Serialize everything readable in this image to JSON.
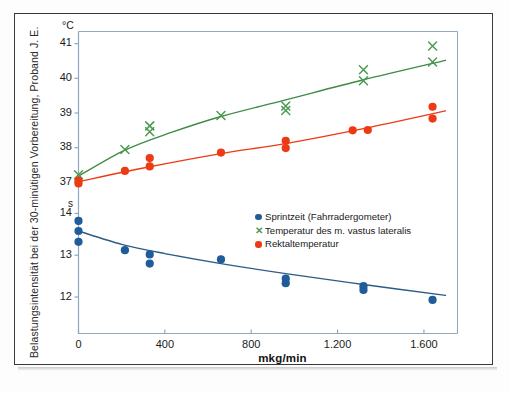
{
  "chart_data": {
    "type": "scatter",
    "title": "",
    "xlabel": "mkg/min",
    "ylabel": "Belastungsintensität bei der 30-minütigen Vorbereitung, Proband J. E.",
    "xlim": [
      -120,
      1760
    ],
    "xticks": [
      0,
      400,
      800,
      1200,
      1600
    ],
    "xticklabels": [
      "0",
      "400",
      "800",
      "1.200",
      "1.600"
    ],
    "axes": [
      {
        "name": "upper-temperature-axis",
        "unit": "°C",
        "ylim": [
          36.55,
          41.35
        ],
        "yticks": [
          37,
          38,
          39,
          40,
          41
        ],
        "yticklabels": [
          "37",
          "38",
          "39",
          "40",
          "41"
        ]
      },
      {
        "name": "lower-time-axis",
        "unit": "s",
        "ylim": [
          11.45,
          14.25
        ],
        "yticks": [
          12,
          13,
          14
        ],
        "yticklabels": [
          "12",
          "13",
          "14"
        ]
      }
    ],
    "grid": false,
    "legend_position": "center-right",
    "series": [
      {
        "name": "Sprintzeit (Fahrradergometer)",
        "axis": "lower-time-axis",
        "marker": "circle",
        "color": "#1F5C99",
        "line_color": "#2B5C86",
        "unit": "s",
        "points": [
          {
            "x": 0,
            "y": 13.82
          },
          {
            "x": 0,
            "y": 13.58
          },
          {
            "x": 0,
            "y": 13.32
          },
          {
            "x": 215,
            "y": 13.12
          },
          {
            "x": 330,
            "y": 13.02
          },
          {
            "x": 330,
            "y": 12.8
          },
          {
            "x": 660,
            "y": 12.9
          },
          {
            "x": 960,
            "y": 12.44
          },
          {
            "x": 960,
            "y": 12.33
          },
          {
            "x": 1320,
            "y": 12.26
          },
          {
            "x": 1320,
            "y": 12.17
          },
          {
            "x": 1640,
            "y": 11.93
          }
        ],
        "fit": [
          {
            "x": 0,
            "y": 13.58
          },
          {
            "x": 200,
            "y": 13.26
          },
          {
            "x": 400,
            "y": 13.04
          },
          {
            "x": 660,
            "y": 12.8
          },
          {
            "x": 960,
            "y": 12.56
          },
          {
            "x": 1320,
            "y": 12.3
          },
          {
            "x": 1700,
            "y": 12.04
          }
        ]
      },
      {
        "name": "Temperatur des m. vastus lateralis",
        "axis": "upper-temperature-axis",
        "marker": "x",
        "color": "#4C9A52",
        "line_color": "#3E8A46",
        "unit": "°C",
        "points": [
          {
            "x": 0,
            "y": 37.22
          },
          {
            "x": 215,
            "y": 37.95
          },
          {
            "x": 330,
            "y": 38.63
          },
          {
            "x": 330,
            "y": 38.46
          },
          {
            "x": 660,
            "y": 38.93
          },
          {
            "x": 960,
            "y": 39.2
          },
          {
            "x": 960,
            "y": 39.07
          },
          {
            "x": 1320,
            "y": 40.25
          },
          {
            "x": 1320,
            "y": 39.93
          },
          {
            "x": 1640,
            "y": 40.93
          },
          {
            "x": 1640,
            "y": 40.47
          }
        ],
        "fit": [
          {
            "x": 0,
            "y": 37.18
          },
          {
            "x": 215,
            "y": 37.93
          },
          {
            "x": 430,
            "y": 38.44
          },
          {
            "x": 660,
            "y": 38.9
          },
          {
            "x": 960,
            "y": 39.38
          },
          {
            "x": 1320,
            "y": 39.96
          },
          {
            "x": 1700,
            "y": 40.52
          }
        ]
      },
      {
        "name": "Rektaltemperatur",
        "axis": "upper-temperature-axis",
        "marker": "circle",
        "color": "#EE3A14",
        "line_color": "#EE3A14",
        "unit": "°C",
        "points": [
          {
            "x": 0,
            "y": 37.05
          },
          {
            "x": 0,
            "y": 36.97
          },
          {
            "x": 215,
            "y": 37.33
          },
          {
            "x": 330,
            "y": 37.7
          },
          {
            "x": 330,
            "y": 37.46
          },
          {
            "x": 660,
            "y": 37.86
          },
          {
            "x": 960,
            "y": 38.2
          },
          {
            "x": 960,
            "y": 37.99
          },
          {
            "x": 1270,
            "y": 38.5
          },
          {
            "x": 1340,
            "y": 38.51
          },
          {
            "x": 1640,
            "y": 39.18
          },
          {
            "x": 1640,
            "y": 38.84
          }
        ],
        "fit": [
          {
            "x": 0,
            "y": 37.02
          },
          {
            "x": 330,
            "y": 37.45
          },
          {
            "x": 660,
            "y": 37.83
          },
          {
            "x": 960,
            "y": 38.12
          },
          {
            "x": 1320,
            "y": 38.55
          },
          {
            "x": 1700,
            "y": 39.06
          }
        ]
      }
    ]
  },
  "legend": {
    "items": [
      {
        "label": "Sprintzeit (Fahrradergometer)",
        "marker": "circle",
        "color": "#1F5C99"
      },
      {
        "label": "Temperatur des m. vastus lateralis",
        "marker": "x",
        "color": "#4C9A52"
      },
      {
        "label": "Rektaltemperatur",
        "marker": "circle",
        "color": "#EE3A14"
      }
    ]
  },
  "axis_labels": {
    "upper_unit": "°C",
    "lower_unit": "s",
    "x_title": "mkg/min",
    "y_title": "Belastungsintensität bei der 30-minütigen Vorbereitung, Proband J. E."
  },
  "colors": {
    "blue": "#1F5C99",
    "blue_line": "#2B5C86",
    "green": "#4C9A52",
    "red": "#EE3A14",
    "axis": "#8FA8BF",
    "frame": "#3a3a3a"
  }
}
